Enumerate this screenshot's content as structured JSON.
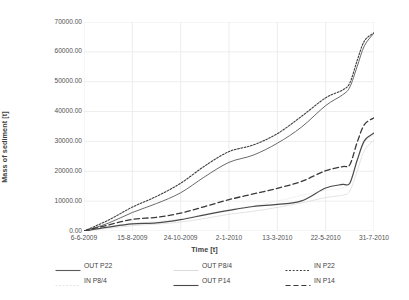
{
  "chart_data": {
    "type": "line",
    "title": "",
    "xlabel": "Time [t]",
    "ylabel": "Mass of sediment [t]",
    "grid": true,
    "legend_position": "bottom",
    "ylim": [
      0,
      70000
    ],
    "ytick_labels": [
      "70000.00",
      "60000.00",
      "50000.00",
      "40000.00",
      "30000.00",
      "20000.00",
      "10000.00",
      "0.00"
    ],
    "ytick_values": [
      70000,
      60000,
      50000,
      40000,
      30000,
      20000,
      10000,
      0
    ],
    "xtick_labels": [
      "6-6-2009",
      "15-8-2009",
      "24-10-2009",
      "2-1-2010",
      "13-3-2010",
      "22-5-2010",
      "31-7-2010"
    ],
    "x": [
      0,
      0.5,
      1,
      1.5,
      2,
      2.5,
      3,
      3.5,
      4,
      4.5,
      5,
      5.35,
      5.5,
      5.65,
      5.8,
      6
    ],
    "series": [
      {
        "name": "OUT P22",
        "style": "solid",
        "color": "#595959",
        "width": 0.9,
        "values": [
          0,
          2600,
          6200,
          9200,
          12800,
          18200,
          23000,
          25400,
          29400,
          34800,
          42000,
          45600,
          48200,
          55000,
          62000,
          66300
        ]
      },
      {
        "name": "OUT P8/4",
        "style": "solid",
        "color": "#e0e0e0",
        "width": 0.9,
        "values": [
          0,
          900,
          1800,
          2300,
          3000,
          4200,
          5600,
          6600,
          7900,
          9400,
          11200,
          12000,
          13400,
          20000,
          27000,
          30400
        ]
      },
      {
        "name": "IN P22",
        "style": "dotted",
        "color": "#404040",
        "width": 1.1,
        "values": [
          0,
          3600,
          8000,
          11600,
          16000,
          21800,
          26600,
          28800,
          32600,
          38400,
          44600,
          47200,
          49600,
          57000,
          63600,
          66400
        ]
      },
      {
        "name": "IN P8/4",
        "style": "dotted",
        "color": "#ededed",
        "width": 0.9,
        "values": [
          0,
          1400,
          2600,
          3200,
          4100,
          5600,
          7200,
          8400,
          10000,
          11900,
          13600,
          14400,
          16200,
          23500,
          29600,
          32200
        ]
      },
      {
        "name": "OUT P14",
        "style": "solid",
        "color": "#4a4a4a",
        "width": 1.2,
        "values": [
          0,
          1300,
          2400,
          2700,
          3800,
          5400,
          6900,
          8200,
          8900,
          10100,
          14400,
          15600,
          16000,
          23600,
          30200,
          32800
        ]
      },
      {
        "name": "IN P14",
        "style": "dashed",
        "color": "#3a3a3a",
        "width": 1.3,
        "values": [
          0,
          2000,
          3900,
          4600,
          6000,
          8200,
          10500,
          12400,
          14300,
          16600,
          20200,
          21600,
          22200,
          29600,
          35600,
          37900
        ]
      }
    ]
  },
  "legend": {
    "items": [
      {
        "label": "OUT P22",
        "style": "solid",
        "color": "#595959"
      },
      {
        "label": "OUT P8/4",
        "style": "solid",
        "color": "#dcdcdc"
      },
      {
        "label": "IN P22",
        "style": "dotted",
        "color": "#404040"
      },
      {
        "label": "IN P8/4",
        "style": "dotted",
        "color": "#e4e4e4"
      },
      {
        "label": "OUT P14",
        "style": "solid",
        "color": "#4a4a4a"
      },
      {
        "label": "IN P14",
        "style": "dashed",
        "color": "#3a3a3a"
      }
    ]
  },
  "colors": {
    "grid": "#e9e9e9",
    "axis": "#d9d9d9",
    "text": "#515151"
  }
}
